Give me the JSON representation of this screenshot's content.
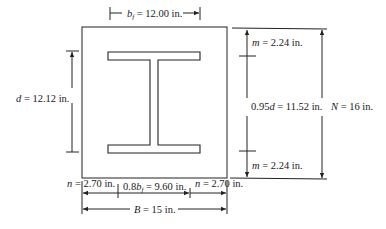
{
  "diagram": {
    "labels": {
      "bf": {
        "sym": "b",
        "sub": "f",
        "text": " = 12.00 in."
      },
      "d": {
        "sym": "d",
        "text": " = 12.12 in."
      },
      "m_top": {
        "sym": "m",
        "text": " = 2.24 in."
      },
      "m_bottom": {
        "sym": "m",
        "text": " = 2.24 in."
      },
      "depth95": {
        "prefix": "0.95",
        "sym": "d",
        "text": " = 11.52 in."
      },
      "N": {
        "sym": "N",
        "text": " = 16 in."
      },
      "n_left": {
        "sym": "n",
        "text": " = 2.70 in."
      },
      "bf80": {
        "prefix": "0.8",
        "sym": "b",
        "sub": "f",
        "text": " = 9.60 in."
      },
      "n_right": {
        "sym": "n",
        "text": " = 2.70 in."
      },
      "B": {
        "sym": "B",
        "text": " = 15 in."
      }
    },
    "values": {
      "bf_in": 12.0,
      "d_in": 12.12,
      "m_in": 2.24,
      "depth_095d_in": 11.52,
      "N_in": 16,
      "n_in": 2.7,
      "bf_08_in": 9.6,
      "B_in": 15
    },
    "colors": {
      "line": "#222222",
      "background": "#ffffff"
    }
  }
}
